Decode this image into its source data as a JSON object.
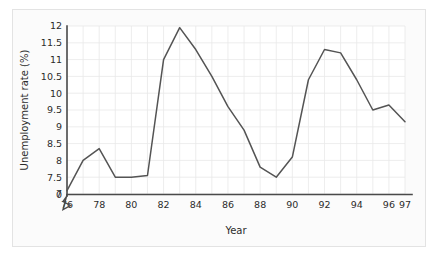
{
  "figure": {
    "background_color": "#ffffff",
    "frame_color": "#e3e3e3",
    "plot_background": "#ffffff"
  },
  "axes": {
    "y_title": "Unemployment rate (%)",
    "x_title": "Year",
    "y_tick_labels": [
      "0",
      "7",
      "7.5",
      "8",
      "8.5",
      "9",
      "9.5",
      "10",
      "10.5",
      "11",
      "11.5",
      "12"
    ],
    "x_tick_labels": [
      "76",
      "78",
      "80",
      "82",
      "84",
      "86",
      "88",
      "90",
      "92",
      "94",
      "96",
      "97"
    ],
    "axis_break": "zigzag-break-between-0-and-7"
  },
  "chart_data": {
    "type": "line",
    "title": "",
    "xlabel": "Year",
    "ylabel": "Unemployment rate (%)",
    "xlim": [
      76,
      97
    ],
    "ylim": [
      7,
      12
    ],
    "y_axis_break": true,
    "y_axis_break_between": [
      0,
      7
    ],
    "grid": true,
    "legend": "none",
    "line_color": "#545454",
    "x": [
      76,
      77,
      78,
      79,
      80,
      81,
      82,
      83,
      84,
      85,
      86,
      87,
      88,
      89,
      90,
      91,
      92,
      93,
      94,
      95,
      96,
      97
    ],
    "x_labels": [
      "76",
      "77",
      "78",
      "79",
      "80",
      "81",
      "82",
      "83",
      "84",
      "85",
      "86",
      "87",
      "88",
      "89",
      "90",
      "91",
      "92",
      "93",
      "94",
      "95",
      "96",
      "97"
    ],
    "series": [
      {
        "name": "Unemployment rate",
        "values": [
          7.1,
          8.0,
          8.35,
          7.5,
          7.5,
          7.55,
          11.0,
          11.95,
          11.3,
          10.5,
          9.6,
          8.9,
          7.8,
          7.5,
          8.1,
          10.4,
          11.3,
          11.2,
          10.4,
          9.5,
          9.65,
          9.15
        ]
      }
    ],
    "ytick_values": [
      7,
      7.5,
      8,
      8.5,
      9,
      9.5,
      10,
      10.5,
      11,
      11.5,
      12
    ],
    "xtick_values": [
      76,
      78,
      80,
      82,
      84,
      86,
      88,
      90,
      92,
      94,
      96,
      97
    ]
  }
}
